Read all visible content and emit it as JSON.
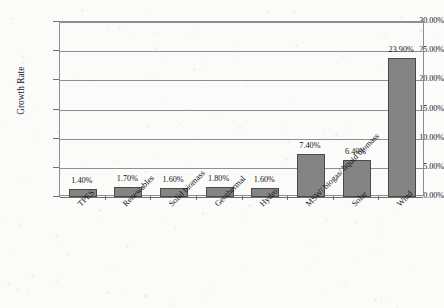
{
  "chart_data": {
    "type": "bar",
    "title": "",
    "xlabel": "",
    "ylabel": "Growth Rate",
    "ylim": [
      0,
      30
    ],
    "ytick_labels": [
      "0.00%",
      "5.00%",
      "10.00%",
      "15.00%",
      "20.00%",
      "25.00%",
      "30.00%"
    ],
    "ytick_values": [
      0,
      5,
      10,
      15,
      20,
      25,
      30
    ],
    "grid": true,
    "legend": "none",
    "value_suffix": "%",
    "categories": [
      "TPES",
      "Renewables",
      "Solid biomass",
      "Geothermal",
      "Hydro",
      "MSW/ biogas/ liquid biomass",
      "Solar",
      "Wind"
    ],
    "values": [
      1.4,
      1.7,
      1.6,
      1.8,
      1.6,
      7.4,
      6.4,
      23.9
    ],
    "value_labels": [
      "1.40%",
      "1.70%",
      "1.60%",
      "1.80%",
      "1.60%",
      "7.40%",
      "6.40%",
      "23.90%"
    ],
    "series": [
      {
        "name": "Growth Rate",
        "values": [
          1.4,
          1.7,
          1.6,
          1.8,
          1.6,
          7.4,
          6.4,
          23.9
        ]
      }
    ],
    "colors": {
      "bar_fill": "#848484",
      "bar_border": "#4a4a4a",
      "gridline": "#8f8f8f",
      "axis": "#6d6d6d",
      "text": "#141414",
      "background": "#fbfbfa"
    }
  }
}
